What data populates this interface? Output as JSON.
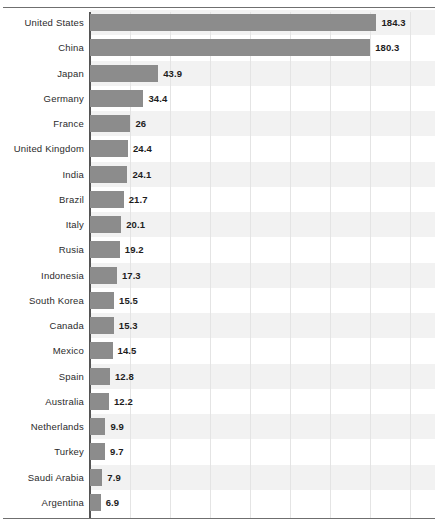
{
  "chart_data": {
    "type": "bar",
    "orientation": "horizontal",
    "title": "",
    "subtitle": "",
    "xlabel": "",
    "ylabel": "",
    "grid": true,
    "legend": false,
    "legend_position": "none",
    "xlim": [
      0,
      222
    ],
    "x_gridline_values": [
      25.8,
      51.5,
      77.3,
      103.0,
      128.8,
      154.6,
      180.3,
      206.1
    ],
    "categories": [
      "United States",
      "China",
      "Japan",
      "Germany",
      "France",
      "United Kingdom",
      "India",
      "Brazil",
      "Italy",
      "Rusia",
      "Indonesia",
      "South Korea",
      "Canada",
      "Mexico",
      "Spain",
      "Australia",
      "Netherlands",
      "Turkey",
      "Saudi Arabia",
      "Argentina"
    ],
    "values": [
      184.3,
      180.3,
      43.9,
      34.4,
      26,
      24.4,
      24.1,
      21.7,
      20.1,
      19.2,
      17.3,
      15.5,
      15.3,
      14.5,
      12.8,
      12.2,
      9.9,
      9.7,
      7.9,
      6.9
    ],
    "value_labels": [
      "184.3",
      "180.3",
      "43.9",
      "34.4",
      "26",
      "24.4",
      "24.1",
      "21.7",
      "20.1",
      "19.2",
      "17.3",
      "15.5",
      "15.3",
      "14.5",
      "12.8",
      "12.2",
      "9.9",
      "9.7",
      "7.9",
      "6.9"
    ]
  },
  "style": {
    "bar_color": "#8c8c8c",
    "band_color": "#f2f2f2",
    "gridline_color": "#e4e4e4",
    "axis_color": "#555555",
    "frame_color": "#6f6f6f",
    "label_color": "#2b2b2b",
    "value_color": "#1d1d1d",
    "background": "#ffffff"
  }
}
